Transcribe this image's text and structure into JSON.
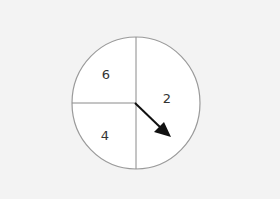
{
  "diagram": {
    "type": "spinner",
    "sections": [
      {
        "label": "6",
        "position": "top-left"
      },
      {
        "label": "2",
        "position": "right-half"
      },
      {
        "label": "4",
        "position": "bottom-left"
      }
    ],
    "pointer": {
      "direction": "down-right",
      "points_to": "2"
    },
    "colors": {
      "background": "#f3f3f3",
      "circle_fill": "#ffffff",
      "circle_stroke": "#9a9a9a",
      "pointer": "#111111"
    }
  }
}
